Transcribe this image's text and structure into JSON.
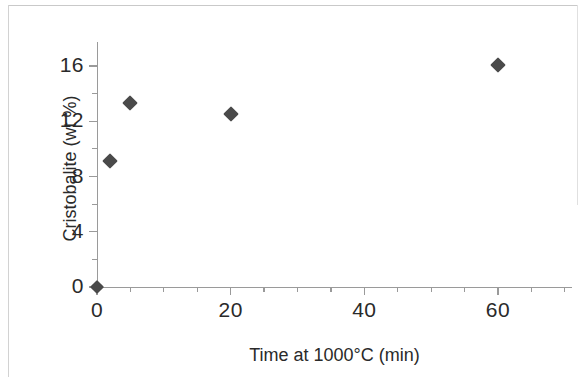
{
  "chart_data": {
    "type": "scatter",
    "title": "",
    "xlabel": "Time at 1000°C (min)",
    "ylabel": "Cristobalite (wt %)",
    "xlim": [
      0,
      71
    ],
    "ylim": [
      0,
      17.8
    ],
    "grid": false,
    "legend": null,
    "x_ticks_major": [
      0,
      20,
      40,
      60
    ],
    "x_tick_labels": [
      "0",
      "20",
      "40",
      "60"
    ],
    "x_ticks_minor": [
      5,
      10,
      15,
      25,
      30,
      35,
      45,
      50,
      55,
      65,
      70
    ],
    "y_ticks_major": [
      0,
      4,
      8,
      12,
      16
    ],
    "y_tick_labels": [
      "0",
      "4",
      "8",
      "12",
      "16"
    ],
    "y_ticks_minor": [
      2,
      6,
      10,
      14
    ],
    "marker_shape": "diamond",
    "marker_color": "#4a4a4a",
    "points": [
      {
        "x": 0,
        "y": 0.0
      },
      {
        "x": 2,
        "y": 9.1
      },
      {
        "x": 5,
        "y": 13.3
      },
      {
        "x": 20,
        "y": 12.5
      },
      {
        "x": 60,
        "y": 16.1
      }
    ],
    "series": [
      {
        "name": "Cristobalite",
        "x": [
          0,
          2,
          5,
          20,
          60
        ],
        "values": [
          0.0,
          9.1,
          13.3,
          12.5,
          16.1
        ]
      }
    ]
  },
  "axes": {
    "x_title": "Time at 1000°C (min)",
    "y_title": "Cristobalite (wt %)"
  },
  "colors": {
    "marker": "#4a4a4a",
    "axis": "#9a9a9a",
    "text": "#2a2a2a",
    "background": "#ffffff"
  }
}
